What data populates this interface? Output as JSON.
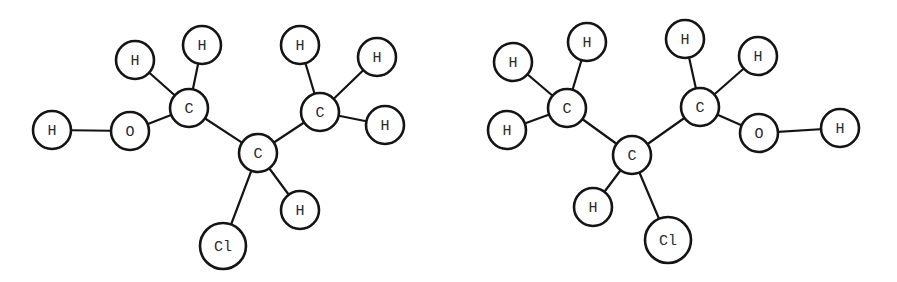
{
  "diagram": {
    "width": 897,
    "height": 282,
    "colors": {
      "stroke": "#141414",
      "label": "#2a2a2a",
      "background": "#ffffff"
    },
    "molecules": [
      {
        "id": "molecule-left",
        "atoms": [
          {
            "id": "L-H-oh",
            "label": "H",
            "x": 52,
            "y": 130,
            "r": 19
          },
          {
            "id": "L-O",
            "label": "O",
            "x": 130,
            "y": 131,
            "r": 19
          },
          {
            "id": "L-C1",
            "label": "C",
            "x": 189,
            "y": 108,
            "r": 19
          },
          {
            "id": "L-H1a",
            "label": "H",
            "x": 135,
            "y": 60,
            "r": 19
          },
          {
            "id": "L-H1b",
            "label": "H",
            "x": 202,
            "y": 45,
            "r": 19
          },
          {
            "id": "L-C2",
            "label": "C",
            "x": 258,
            "y": 153,
            "r": 19
          },
          {
            "id": "L-C3",
            "label": "C",
            "x": 320,
            "y": 112,
            "r": 19
          },
          {
            "id": "L-H3a",
            "label": "H",
            "x": 300,
            "y": 45,
            "r": 19
          },
          {
            "id": "L-H3b",
            "label": "H",
            "x": 377,
            "y": 57,
            "r": 19
          },
          {
            "id": "L-H3c",
            "label": "H",
            "x": 385,
            "y": 125,
            "r": 19
          },
          {
            "id": "L-H2",
            "label": "H",
            "x": 300,
            "y": 210,
            "r": 19
          },
          {
            "id": "L-Cl",
            "label": "Cl",
            "x": 223,
            "y": 246,
            "r": 23
          }
        ],
        "bonds": [
          [
            "L-H-oh",
            "L-O"
          ],
          [
            "L-O",
            "L-C1"
          ],
          [
            "L-C1",
            "L-H1a"
          ],
          [
            "L-C1",
            "L-H1b"
          ],
          [
            "L-C1",
            "L-C2"
          ],
          [
            "L-C2",
            "L-C3"
          ],
          [
            "L-C3",
            "L-H3a"
          ],
          [
            "L-C3",
            "L-H3b"
          ],
          [
            "L-C3",
            "L-H3c"
          ],
          [
            "L-C2",
            "L-H2"
          ],
          [
            "L-C2",
            "L-Cl"
          ]
        ]
      },
      {
        "id": "molecule-right",
        "atoms": [
          {
            "id": "R-H1a",
            "label": "H",
            "x": 513,
            "y": 62,
            "r": 19
          },
          {
            "id": "R-H1b",
            "label": "H",
            "x": 587,
            "y": 42,
            "r": 19
          },
          {
            "id": "R-C1",
            "label": "C",
            "x": 567,
            "y": 108,
            "r": 19
          },
          {
            "id": "R-H1c",
            "label": "H",
            "x": 507,
            "y": 130,
            "r": 19
          },
          {
            "id": "R-C2",
            "label": "C",
            "x": 632,
            "y": 155,
            "r": 19
          },
          {
            "id": "R-C3",
            "label": "C",
            "x": 700,
            "y": 107,
            "r": 19
          },
          {
            "id": "R-H3a",
            "label": "H",
            "x": 685,
            "y": 39,
            "r": 19
          },
          {
            "id": "R-H3b",
            "label": "H",
            "x": 758,
            "y": 56,
            "r": 19
          },
          {
            "id": "R-O",
            "label": "O",
            "x": 759,
            "y": 133,
            "r": 19
          },
          {
            "id": "R-H-oh",
            "label": "H",
            "x": 840,
            "y": 128,
            "r": 19
          },
          {
            "id": "R-H2",
            "label": "H",
            "x": 593,
            "y": 207,
            "r": 19
          },
          {
            "id": "R-Cl",
            "label": "Cl",
            "x": 668,
            "y": 240,
            "r": 23
          }
        ],
        "bonds": [
          [
            "R-C1",
            "R-H1a"
          ],
          [
            "R-C1",
            "R-H1b"
          ],
          [
            "R-C1",
            "R-H1c"
          ],
          [
            "R-C1",
            "R-C2"
          ],
          [
            "R-C2",
            "R-C3"
          ],
          [
            "R-C3",
            "R-H3a"
          ],
          [
            "R-C3",
            "R-H3b"
          ],
          [
            "R-C3",
            "R-O"
          ],
          [
            "R-O",
            "R-H-oh"
          ],
          [
            "R-C2",
            "R-H2"
          ],
          [
            "R-C2",
            "R-Cl"
          ]
        ]
      }
    ]
  }
}
